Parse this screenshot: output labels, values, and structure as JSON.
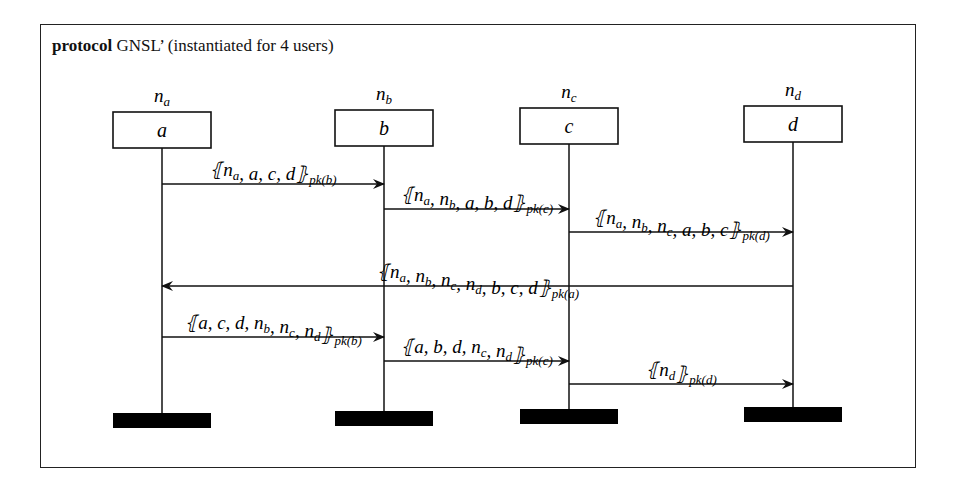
{
  "title": {
    "keyword": "protocol",
    "name": "GNSL’ (instantiated for 4 users)"
  },
  "participants": [
    {
      "role": "a",
      "nonce": "n_a",
      "x": 162
    },
    {
      "role": "b",
      "nonce": "n_b",
      "x": 384
    },
    {
      "role": "c",
      "nonce": "n_c",
      "x": 569
    },
    {
      "role": "d",
      "nonce": "n_d",
      "x": 793
    }
  ],
  "messages": [
    {
      "from": "a",
      "to": "b",
      "content": "{|n_a, a, c, d|}_pk(b)",
      "label_main": "⦃n",
      "y": 184
    },
    {
      "from": "b",
      "to": "c",
      "content": "{|n_a, n_b, a, b, d|}_pk(c)",
      "y": 209
    },
    {
      "from": "c",
      "to": "d",
      "content": "{|n_a, n_b, n_c, a, b, c|}_pk(d)",
      "y": 232
    },
    {
      "from": "d",
      "to": "a",
      "content": "{|n_a, n_b, n_c, n_d, b, c, d|}_pk(a)",
      "y": 286
    },
    {
      "from": "a",
      "to": "b",
      "content": "{|a, c, d, n_b, n_c, n_d|}_pk(b)",
      "y": 337
    },
    {
      "from": "b",
      "to": "c",
      "content": "{|a, b, d, n_c, n_d|}_pk(c)",
      "y": 361
    },
    {
      "from": "c",
      "to": "d",
      "content": "{|n_d|}_pk(d)",
      "y": 384
    }
  ]
}
